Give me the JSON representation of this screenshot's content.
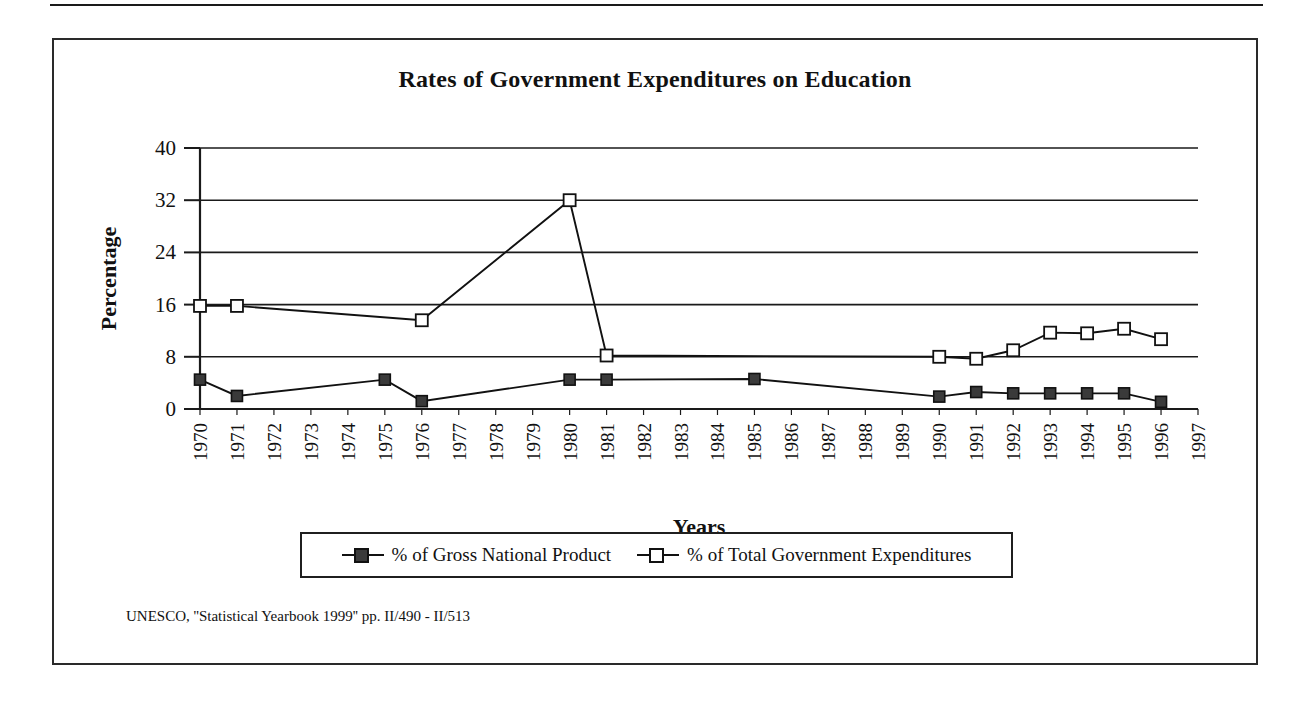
{
  "figure": {
    "title": "Rates of Government Expenditures on Education",
    "source_note": "UNESCO, ''Statistical Yearbook 1999'' pp. II/490 - II/513"
  },
  "legend": {
    "entries": [
      {
        "label": "% of Gross National Product",
        "marker": "filled-square-icon"
      },
      {
        "label": "% of Total Government Expenditures",
        "marker": "open-square-icon"
      }
    ]
  },
  "chart_data": {
    "type": "line",
    "title": "Rates of Government Expenditures on Education",
    "xlabel": "Years",
    "ylabel": "Percentage",
    "ylim": [
      0,
      40
    ],
    "yticks": [
      0,
      8,
      16,
      24,
      32,
      40
    ],
    "grid": true,
    "legend_position": "below-plot",
    "categories": [
      "1970",
      "1971",
      "1972",
      "1973",
      "1974",
      "1975",
      "1976",
      "1977",
      "1978",
      "1979",
      "1980",
      "1981",
      "1982",
      "1983",
      "1984",
      "1985",
      "1986",
      "1987",
      "1988",
      "1989",
      "1990",
      "1991",
      "1992",
      "1993",
      "1994",
      "1995",
      "1996",
      "1997"
    ],
    "series": [
      {
        "name": "% of Gross National Product",
        "marker": "filled-square",
        "points": [
          {
            "x": "1970",
            "y": 4.5
          },
          {
            "x": "1971",
            "y": 2.0
          },
          {
            "x": "1975",
            "y": 4.5
          },
          {
            "x": "1976",
            "y": 1.2
          },
          {
            "x": "1980",
            "y": 4.5
          },
          {
            "x": "1981",
            "y": 4.5
          },
          {
            "x": "1985",
            "y": 4.6
          },
          {
            "x": "1990",
            "y": 1.9
          },
          {
            "x": "1991",
            "y": 2.6
          },
          {
            "x": "1992",
            "y": 2.4
          },
          {
            "x": "1993",
            "y": 2.4
          },
          {
            "x": "1994",
            "y": 2.4
          },
          {
            "x": "1995",
            "y": 2.4
          },
          {
            "x": "1996",
            "y": 1.1
          }
        ]
      },
      {
        "name": "% of Total Government Expenditures",
        "marker": "open-square",
        "points": [
          {
            "x": "1970",
            "y": 15.8
          },
          {
            "x": "1971",
            "y": 15.8
          },
          {
            "x": "1976",
            "y": 13.6
          },
          {
            "x": "1980",
            "y": 32.0
          },
          {
            "x": "1981",
            "y": 8.2
          },
          {
            "x": "1990",
            "y": 8.0
          },
          {
            "x": "1991",
            "y": 7.7
          },
          {
            "x": "1992",
            "y": 9.0
          },
          {
            "x": "1993",
            "y": 11.7
          },
          {
            "x": "1994",
            "y": 11.6
          },
          {
            "x": "1995",
            "y": 12.3
          },
          {
            "x": "1996",
            "y": 10.7
          }
        ]
      }
    ]
  }
}
